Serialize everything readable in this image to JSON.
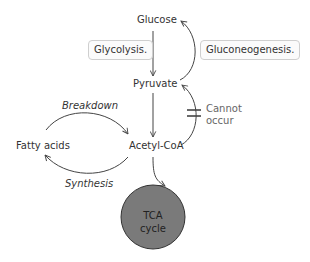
{
  "diagram": {
    "nodes": {
      "glucose": "Glucose",
      "pyruvate": "Pyruvate",
      "acetyl_coa": "Acetyl-CoA",
      "fatty_acids": "Fatty acids",
      "tca_line1": "TCA",
      "tca_line2": "cycle"
    },
    "boxes": {
      "glycolysis": "Glycolysis.",
      "gluconeogenesis": "Gluconeogenesis."
    },
    "edge_labels": {
      "breakdown": "Breakdown",
      "synthesis": "Synthesis",
      "cannot_line1": "Cannot",
      "cannot_line2": "occur"
    },
    "colors": {
      "tca_fill": "#7a7a7a",
      "line": "#444444",
      "box_border": "#cfcfcf"
    }
  }
}
